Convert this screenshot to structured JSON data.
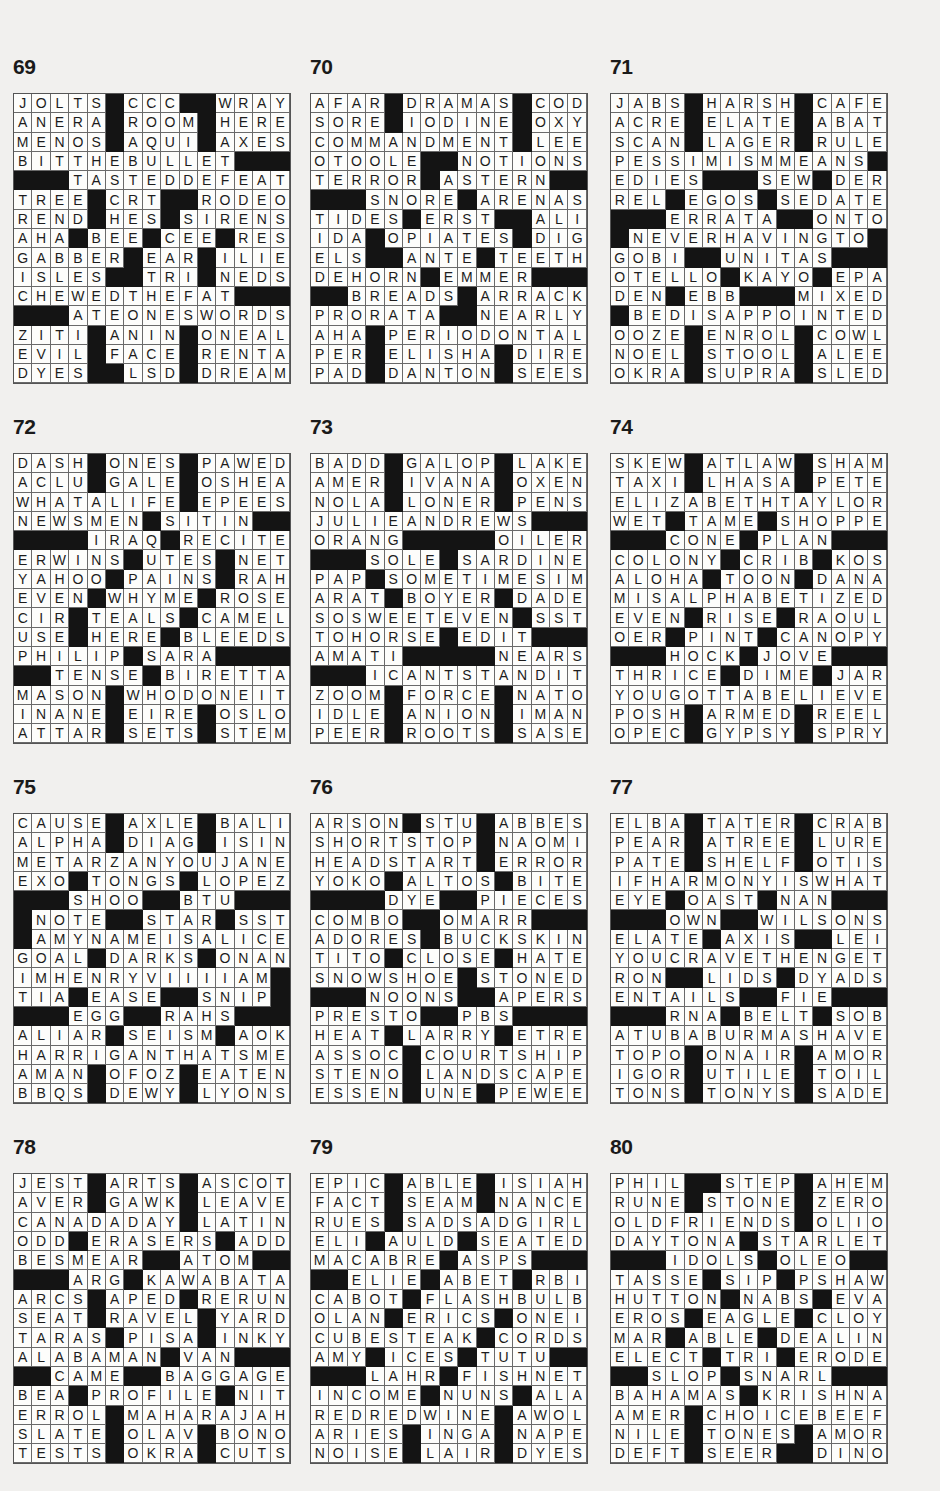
{
  "puzzles": [
    {
      "number": "69",
      "rows": [
        "JOLTS#CCC##WRAY",
        "ANERA#ROOM#HERE",
        "MENOS#AQUI#AXES",
        "BITTHEBULLET###",
        "###TASTEDDEFEAT",
        "TREE#CRT##RODEO",
        "REND#HES#SIRENS",
        "AHA#BEE#CEE#RES",
        "GABBER#EAR#ILIE",
        "ISLES##TRI#NEDS",
        "CHEWEDTHEFAT###",
        "###ATEONESWORDS",
        "ZITI#ANIN#ONEAL",
        "EVIL#FACE#RENTA",
        "DYES##LSD#DREAM"
      ]
    },
    {
      "number": "70",
      "rows": [
        "AFAR#DRAMAS#COD",
        "SORE#IODINE#OXY",
        "COMMANDMENT#LEE",
        "OTOOLE##NOTIONS",
        "TERROR#ASTERN##",
        "###SNORE#ARENAS",
        "TIDES#ERST##ALI",
        "IDA#OPIATES#DIG",
        "ELS##ANTE#TEETH",
        "DEHORN#EMMER###",
        "##BREADS#ARRACK",
        "PRORATA##NEARLY",
        "AHA#PERIODONTAL",
        "PER#ELISHA#DIRE",
        "PAD#DANTON#SEES"
      ]
    },
    {
      "number": "71",
      "rows": [
        "JABS#HARSH#CAFE",
        "ACRE#ELATE#ABAT",
        "SCAN#LAGER#RULE",
        "PESSIMISMMEANS#",
        "EDIES###SEW#DER",
        "REL#EGOS#SEDATE",
        "###ERRATA##ONTO",
        "#NEVERHAVINGTO#",
        "GOBI##UNITAS###",
        "OTELLO#KAYO#EPA",
        "DEN#EBB###MIXED",
        "#BEDISAPPOINTED",
        "OOZE#ENROL#COWL",
        "NOEL#STOOL#ALEE",
        "OKRA#SUPRA#SLED"
      ]
    },
    {
      "number": "72",
      "rows": [
        "DASH#ONES#PAWED",
        "ACLU#GALE#OSHEA",
        "WHATALIFE#EPEES",
        "NEWSMEN#SITIN##",
        "####IRAQ#RECITE",
        "ERWINS#UTES#NET",
        "YAHOO#PAINS#RAH",
        "EVEN#WHYME#ROSE",
        "CIR#TEALS#CAMEL",
        "USE#HERE#BLEEDS",
        "PHILIP#SARA####",
        "##TENSE#BIRETTA",
        "MASON#WHODONEIT",
        "INANE#EIRE#OSLO",
        "ATTAR#SETS#STEM"
      ]
    },
    {
      "number": "73",
      "rows": [
        "BADD#GALOP#LAKE",
        "AMER#IVANA#OXEN",
        "NOLA#LONER#PENS",
        "JULIEANDREWS###",
        "ORANG#####OILER",
        "###SOLE#SARDINE",
        "PAP#SOMETIMESIM",
        "ARAT#BOYER#DADE",
        "SOSWEETEVEN#SST",
        "TOHORSE#EDIT###",
        "AMATI#####NEARS",
        "###ICANTSTANDIT",
        "ZOOM#FORCE#NATO",
        "IDLE#ANION#IMAN",
        "PEER#ROOTS#SASE"
      ]
    },
    {
      "number": "74",
      "rows": [
        "SKEW#ATLAW#SHAM",
        "TAXI#LHASA#PETE",
        "ELIZABETHTAYLOR",
        "WET#TAME#SHOPPE",
        "###CONE#PLAN###",
        "COLONY#CRIB#KOS",
        "ALOHA#TOON#DANA",
        "MISALPHABETIZED",
        "EVEN#RISE#RAOUL",
        "OER#PINT#CANOPY",
        "###HOCK#JOVE###",
        "THRICE#DIME#JAR",
        "YOUGOTTABELIEVE",
        "POSH#ARMED#REEL",
        "OPEC#GYPSY#SPRY"
      ]
    },
    {
      "number": "75",
      "rows": [
        "CAUSE#AXLE#BALI",
        "ALPHA#DIAG#ISIN",
        "METARZANYOUJANE",
        "EXO#TONGS#LOPEZ",
        "###SHOO##BTU###",
        "#NOTE##STAR#SST",
        "#AMYNAMEISALICE",
        "GOAL#DARKS#ONAN",
        "IMHENRYVIIIIAM#",
        "TIA#EASE##SNIP#",
        "###EGG##RAHS###",
        "ALIAR#SEISM#AOK",
        "HARRIGANTHATSME",
        "AMAN#OFOZ#EATEN",
        "BBQS#DEWY#LYONS"
      ]
    },
    {
      "number": "76",
      "rows": [
        "ARSON#STU#ABBES",
        "SHORTSTOP#NAOMI",
        "HEADSTART#ERROR",
        "YOKO#ALTOS#BITE",
        "####DYE##PIECES",
        "COMBO##OMARR###",
        "ADORES#BUCKSKIN",
        "TITO#CLOSE#HATE",
        "SNOWSHOE#STONED",
        "###NOONS##APERS",
        "PRESTO##PBS####",
        "HEAT#LARRY#ETRE",
        "ASSOC#COURTSHIP",
        "STENO#LANDSCAPE",
        "ESSEN#UNE#PEWEE"
      ]
    },
    {
      "number": "77",
      "rows": [
        "ELBA#TATER#CRAB",
        "PEAR#ATREE#LURE",
        "PATE#SHELF#OTIS",
        "IFHARMONYISWHAT",
        "EYE#OAST#NAN###",
        "###OWN##WILSONS",
        "ELATE#AXIS##LEI",
        "YOUCRAVETHENGET",
        "RON##LIDS#DYADS",
        "ENTAILS##FIE###",
        "###RNA#BELT#SOB",
        "ATUBABURMASHAVE",
        "TOPO#ONAIR#AMOR",
        "IGOR#UTILE#TOIL",
        "TONS#TONYS#SADE"
      ]
    },
    {
      "number": "78",
      "rows": [
        "JEST#ARTS#ASCOT",
        "AVER#GAWK#LEAVE",
        "CANADADAY#LATIN",
        "ODD#ERASERS#ADD",
        "BESMEAR##ATOM##",
        "###ARG#KAWABATA",
        "ARCS#APED#RERUN",
        "SEAT#RAVEL#YARD",
        "TARAS#PISA#INKY",
        "ALABAMAN#VAN###",
        "##CAME##BAGGAGE",
        "BEA#PROFILE#NIT",
        "ERROL#MAHARAJAH",
        "SLATE#OLAV#BONO",
        "TESTS#OKRA#CUTS"
      ]
    },
    {
      "number": "79",
      "rows": [
        "EPIC#ABLE#ISIAH",
        "FACT#SEAM#NANCE",
        "RUES#SADSADGIRL",
        "ELI#AULD#SEATED",
        "MACABRE#ASPS###",
        "##ELIE#ABET#RBI",
        "CABOT#FLASHBULB",
        "OLAN#ERICS#ONEI",
        "CUBESTEAK#CORDS",
        "AMY#ICES#TUTU##",
        "###LAHR#FISHNET",
        "INCOME#NUNS#ALA",
        "REDREDWINE#AWOL",
        "ARIES#INGA#NAPE",
        "NOISE#LAIR#DYES"
      ]
    },
    {
      "number": "80",
      "rows": [
        "PHIL##STEP#AHEM",
        "RUNE#STONE#ZERO",
        "OLDFRIENDS#OLIO",
        "DAYTONA#STARLET",
        "###IDOLS#OLEO##",
        "TASSE#SIP#PSHAW",
        "HUTTON#NABS#EVA",
        "EROS#EAGLE#CLOY",
        "MAR#ABLE#DEALIN",
        "ELECT#TRI#ERODE",
        "##SLOP#SNARL###",
        "BAHAMAS#KRISHNA",
        "AMER#CHOICEBEEF",
        "NILE#TONES#AMOR",
        "DEFT#SEER##DINO"
      ]
    }
  ]
}
